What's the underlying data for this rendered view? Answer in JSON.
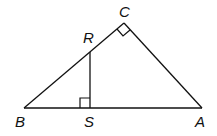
{
  "diagram": {
    "type": "geometry",
    "stroke_color": "#111111",
    "background": "#ffffff",
    "points": {
      "A": {
        "label": "A",
        "x": 202,
        "y": 108
      },
      "B": {
        "label": "B",
        "x": 24,
        "y": 108
      },
      "C": {
        "label": "C",
        "x": 124,
        "y": 23
      },
      "R": {
        "label": "R",
        "x": 90,
        "y": 52
      },
      "S": {
        "label": "S",
        "x": 90,
        "y": 108
      }
    },
    "labels": {
      "A": "A",
      "B": "B",
      "C": "C",
      "R": "R",
      "S": "S"
    },
    "segments": [
      [
        "B",
        "C"
      ],
      [
        "C",
        "A"
      ],
      [
        "B",
        "A"
      ],
      [
        "R",
        "S"
      ]
    ],
    "right_angles": [
      "C",
      "S"
    ]
  }
}
